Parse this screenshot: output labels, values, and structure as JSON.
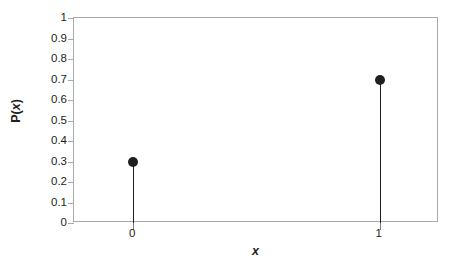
{
  "chart_data": {
    "type": "scatter",
    "plot_style": "stem",
    "title": "",
    "subtitle": "",
    "xlabel": "x",
    "ylabel": "P(x)",
    "x": [
      0,
      1
    ],
    "values": [
      0.3,
      0.7
    ],
    "categories": [
      "0",
      "1"
    ],
    "series": [
      {
        "name": "P(x)",
        "values": [
          0.3,
          0.7
        ],
        "marker": "filled-circle",
        "color": "#231f20"
      }
    ],
    "xlim": [
      -0.24,
      1.24
    ],
    "ylim": [
      0,
      1
    ],
    "x_tick_labels": [
      "0",
      "1"
    ],
    "x_tick_values": [
      0,
      1
    ],
    "y_tick_labels": [
      "0",
      "0.1",
      "0.2",
      "0.3",
      "0.4",
      "0.5",
      "0.6",
      "0.7",
      "0.8",
      "0.9",
      "1"
    ],
    "y_tick_values": [
      0,
      0.1,
      0.2,
      0.3,
      0.4,
      0.5,
      0.6,
      0.7,
      0.8,
      0.9,
      1
    ],
    "grid": false,
    "legend": false,
    "legend_position": "none",
    "annotations": [],
    "colors": {
      "marker": "#231f20",
      "stem": "#231f20",
      "axis": "#a7a9ac",
      "tick": "#808285",
      "text": "#231f20",
      "background": "#ffffff"
    }
  },
  "axis_titles": {
    "y_prefix": "P(",
    "y_variable": "x",
    "y_suffix": ")",
    "x": "x"
  }
}
